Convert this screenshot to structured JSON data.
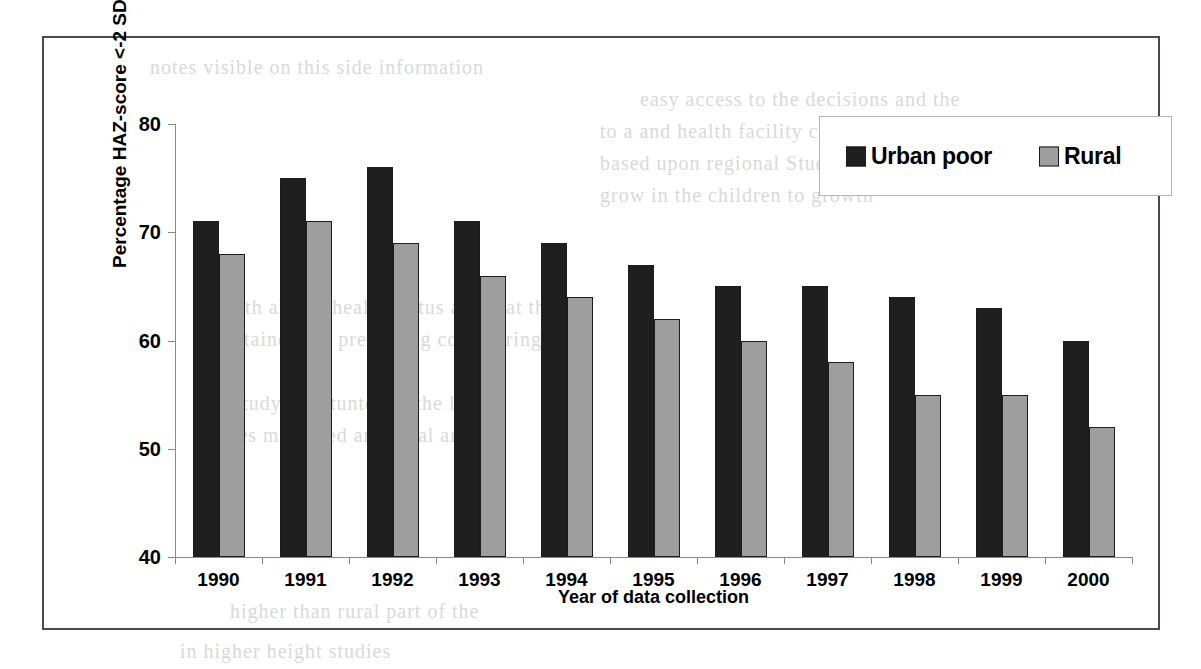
{
  "chart_data": {
    "type": "bar",
    "title": "",
    "xlabel": "Year of data collection",
    "ylabel": "Percentage HAZ-score <-2 SD",
    "categories": [
      "1990",
      "1991",
      "1992",
      "1993",
      "1994",
      "1995",
      "1996",
      "1997",
      "1998",
      "1999",
      "2000"
    ],
    "series": [
      {
        "name": "Urban poor",
        "color": "#1f1f1f",
        "values": [
          71,
          75,
          76,
          71,
          69,
          67,
          65,
          65,
          64,
          63,
          60
        ]
      },
      {
        "name": "Rural",
        "color": "#9e9e9e",
        "values": [
          68,
          71,
          69,
          66,
          64,
          62,
          60,
          58,
          55,
          55,
          52
        ]
      }
    ],
    "ylim": [
      40,
      80
    ],
    "yticks": [
      40,
      50,
      60,
      70,
      80
    ],
    "ytick_labels": [
      "40",
      "50",
      "60",
      "70",
      "80"
    ],
    "grid": false,
    "legend_position": "top-right",
    "axis_color": "#8a8a8a",
    "frame_color": "#4a4a52"
  },
  "legend": {
    "items": [
      {
        "label": "Urban poor",
        "swatch": "dark-square-icon"
      },
      {
        "label": "Rural",
        "swatch": "gray-square-icon"
      }
    ]
  },
  "background_bleed": [
    {
      "text": "notes visible on this side information",
      "x": 150,
      "y": 56
    },
    {
      "text": "easy access to the decisions and the",
      "x": 640,
      "y": 88
    },
    {
      "text": "to a and health facility carried out",
      "x": 600,
      "y": 120
    },
    {
      "text": "based upon regional  Studies",
      "x": 600,
      "y": 152
    },
    {
      "text": "grow in the children  to growth",
      "x": 600,
      "y": 184
    },
    {
      "text": "growth also is health status and that the",
      "x": 200,
      "y": 296
    },
    {
      "text": "maintained the presenting considering",
      "x": 200,
      "y": 328
    },
    {
      "text": "the study  are stunted to the level",
      "x": 200,
      "y": 392
    },
    {
      "text": "values measured and rural areas",
      "x": 200,
      "y": 424
    },
    {
      "text": "higher than rural part of the",
      "x": 230,
      "y": 600
    },
    {
      "text": "in higher  height  studies",
      "x": 180,
      "y": 640
    }
  ]
}
